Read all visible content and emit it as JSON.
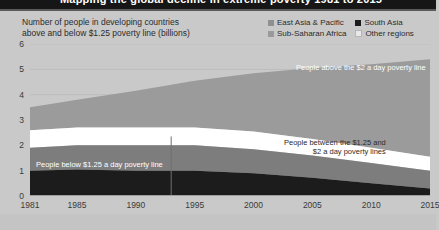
{
  "banner": {
    "text": "Mapping the global decline in extreme poverty 1981 to 2015",
    "background_color": "#161616"
  },
  "header": {
    "subtitle_line1": "Number of people in developing countries",
    "subtitle_line2": "above and below $1.25 poverty line (billions)"
  },
  "legend": {
    "items": [
      {
        "label": "East Asia & Pacific",
        "color": "#8f8f8f"
      },
      {
        "label": "South Asia",
        "color": "#1c1c1c"
      },
      {
        "label": "Sub-Saharan Africa",
        "color": "#9a9a9a"
      },
      {
        "label": "Other regions",
        "color": "#e8e8e8"
      }
    ]
  },
  "annotations": {
    "above_two_dollar": "People above the $2 a day poverty line",
    "between_line1": "People between the $1.25 and",
    "between_line2": "$2 a day poverty lines",
    "below_125": "People below $1.25 a day poverty line"
  },
  "chart_data": {
    "type": "area",
    "title": "Number of people in developing countries above and below $1.25 poverty line (billions)",
    "xlabel": "",
    "ylabel": "billions of people",
    "xlim": [
      1981,
      2015
    ],
    "ylim": [
      0,
      6
    ],
    "ytick_labels": [
      "0",
      "1",
      "2",
      "3",
      "4",
      "5",
      "6"
    ],
    "ytick_values": [
      0,
      1,
      2,
      3,
      4,
      5,
      6
    ],
    "xtick_labels": [
      "1981",
      "1985",
      "1990",
      "1995",
      "2000",
      "2005",
      "2010",
      "2015"
    ],
    "xtick_values": [
      1981,
      1985,
      1990,
      1995,
      2000,
      2005,
      2010,
      2015
    ],
    "grid": true,
    "legend_position": "top-right",
    "stacked": true,
    "marker_line_year": 1993,
    "x": [
      1981,
      1985,
      1990,
      1995,
      2000,
      2005,
      2010,
      2015
    ],
    "series": [
      {
        "name": "People below $1.25 a day poverty line",
        "color": "#1c1c1c",
        "values": [
          1.0,
          1.05,
          1.0,
          1.0,
          0.9,
          0.72,
          0.5,
          0.3
        ]
      },
      {
        "name": "People between the $1.25 and $2 a day poverty lines",
        "color": "#7d7d7d",
        "values": [
          0.9,
          0.95,
          1.0,
          1.0,
          0.95,
          0.88,
          0.8,
          0.7
        ]
      },
      {
        "name": "Gap band (white separator)",
        "color": "#ffffff",
        "values": [
          0.7,
          0.7,
          0.7,
          0.7,
          0.7,
          0.65,
          0.6,
          0.55
        ]
      },
      {
        "name": "People above the $2 a day poverty line",
        "color": "#9b9b9b",
        "values": [
          0.9,
          1.1,
          1.45,
          1.85,
          2.3,
          2.8,
          3.3,
          3.85
        ]
      }
    ],
    "stack_tops": {
      "below_125": [
        1.0,
        1.05,
        1.0,
        1.0,
        0.9,
        0.72,
        0.5,
        0.3
      ],
      "between": [
        1.9,
        2.0,
        2.0,
        2.0,
        1.85,
        1.6,
        1.3,
        1.0
      ],
      "gap_top": [
        2.6,
        2.7,
        2.7,
        2.7,
        2.55,
        2.25,
        1.9,
        1.55
      ],
      "total": [
        3.5,
        3.8,
        4.15,
        4.55,
        4.85,
        5.05,
        5.2,
        5.4
      ]
    }
  }
}
